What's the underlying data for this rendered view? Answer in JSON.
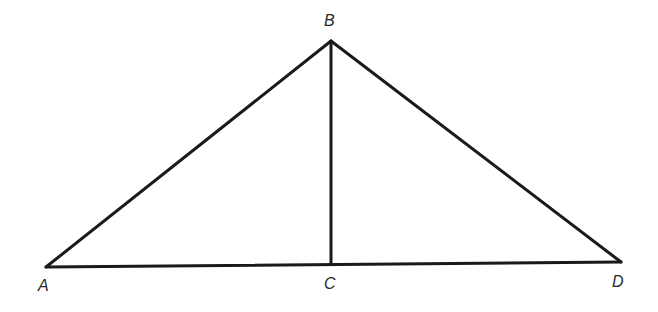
{
  "diagram": {
    "title": "",
    "stroke_color": "#1a1a1a",
    "label_color": "#2a2a2a",
    "points": {
      "A": {
        "label": "A",
        "x": 46,
        "y": 267
      },
      "B": {
        "label": "B",
        "x": 331,
        "y": 41
      },
      "C": {
        "label": "C",
        "x": 331,
        "y": 264
      },
      "D": {
        "label": "D",
        "x": 621,
        "y": 262
      }
    },
    "segments": [
      "AB",
      "BD",
      "AD",
      "BC"
    ]
  }
}
